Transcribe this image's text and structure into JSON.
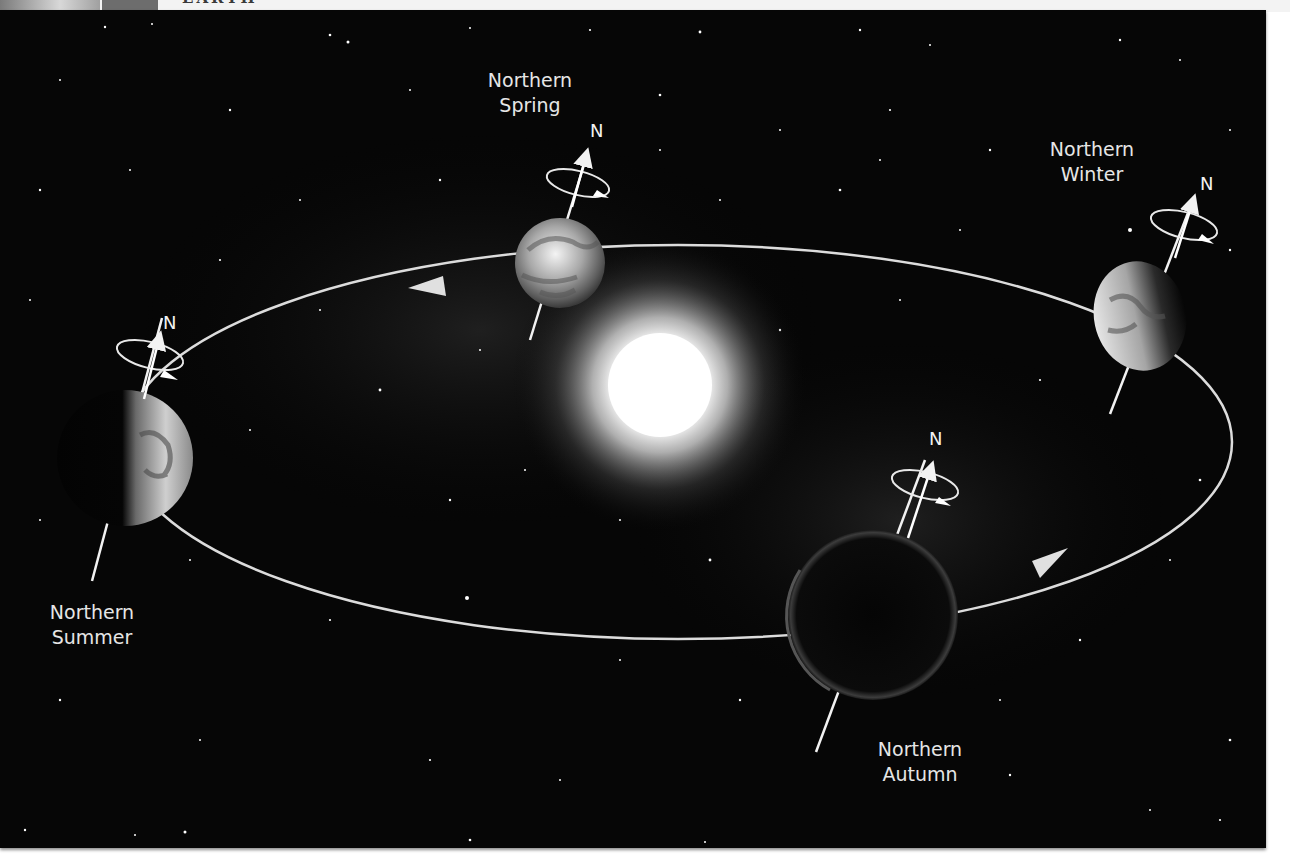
{
  "header": {
    "title": "EARTH",
    "colors": {
      "photo": "#a0a0a0",
      "box": "#6d6d6d",
      "bar": "#f3f3f3"
    }
  },
  "diagram": {
    "background": "#060606",
    "sun": {
      "x": 660,
      "y": 385,
      "radius": 55,
      "color": "#ffffff"
    },
    "orbit": {
      "cx": 678,
      "cy": 442,
      "rx": 554,
      "ry": 197,
      "color": "#dcdcdc",
      "direction": "counter-clockwise"
    },
    "north_label": "N",
    "positions": [
      {
        "id": "spring",
        "line1": "Northern",
        "line2": "Spring",
        "label_x": 508,
        "label_y": 70,
        "n_x": 593,
        "n_y": 120,
        "planet_x": 560,
        "planet_y": 263,
        "planet_r": 45,
        "lit": "full"
      },
      {
        "id": "winter",
        "line1": "Northern",
        "line2": "Winter",
        "label_x": 1090,
        "label_y": 137,
        "n_x": 1200,
        "n_y": 172,
        "planet_x": 1138,
        "planet_y": 316,
        "planet_r": 48,
        "lit": "left"
      },
      {
        "id": "summer",
        "line1": "Northern",
        "line2": "Summer",
        "label_x": 92,
        "label_y": 600,
        "n_x": 165,
        "n_y": 312,
        "planet_x": 125,
        "planet_y": 458,
        "planet_r": 68,
        "lit": "right"
      },
      {
        "id": "autumn",
        "line1": "Northern",
        "line2": "Autumn",
        "label_x": 918,
        "label_y": 737,
        "n_x": 930,
        "n_y": 428,
        "planet_x": 873,
        "planet_y": 615,
        "planet_r": 85,
        "lit": "none"
      }
    ]
  }
}
